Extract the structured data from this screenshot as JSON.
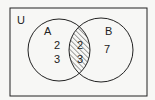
{
  "diagram": {
    "type": "venn",
    "universe_label": "U",
    "sets": [
      {
        "label": "A",
        "only_elements": [
          "2",
          "3"
        ]
      },
      {
        "label": "B",
        "only_elements": [
          "7"
        ]
      }
    ],
    "intersection": {
      "elements": [
        "2",
        "3"
      ],
      "shaded": true
    },
    "colors": {
      "stroke": "#222222",
      "background": "#f7f7f5",
      "hatch": "#333333"
    }
  }
}
